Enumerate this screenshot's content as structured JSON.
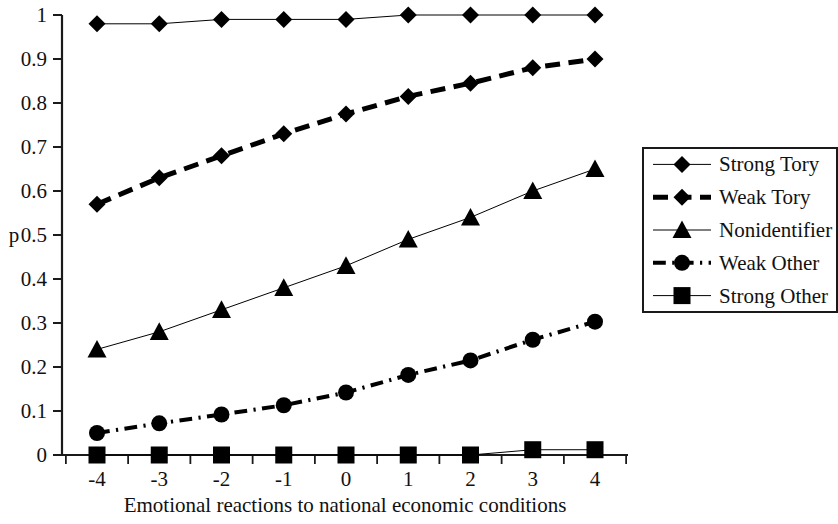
{
  "chart_data": {
    "type": "line",
    "title": "",
    "subtitle": "",
    "xlabel": "Emotional reactions to national economic conditions",
    "ylabel": "p",
    "x": [
      -4,
      -3,
      -2,
      -1,
      0,
      1,
      2,
      3,
      4
    ],
    "categories": [
      "-4",
      "-3",
      "-2",
      "-1",
      "0",
      "1",
      "2",
      "3",
      "4"
    ],
    "xtick_labels": [
      "-4",
      "-3",
      "-2",
      "-1",
      "0",
      "1",
      "2",
      "3",
      "4"
    ],
    "ytick_labels": [
      "0",
      "0.1",
      "0.2",
      "0.3",
      "0.4",
      "0.5",
      "0.6",
      "0.7",
      "0.8",
      "0.9",
      "1"
    ],
    "ytick_values": [
      0,
      0.1,
      0.2,
      0.3,
      0.4,
      0.5,
      0.6,
      0.7,
      0.8,
      0.9,
      1
    ],
    "xlim": [
      -4.6,
      4.6
    ],
    "ylim": [
      0,
      1
    ],
    "grid": false,
    "legend_position": "right",
    "series": [
      {
        "name": "Strong Tory",
        "marker": "diamond",
        "line_style": "solid",
        "line_width": 1,
        "color": "#000000",
        "values": [
          0.98,
          0.98,
          0.99,
          0.99,
          0.99,
          1.0,
          1.0,
          1.0,
          1.0
        ]
      },
      {
        "name": "Weak Tory",
        "marker": "diamond",
        "line_style": "dashed",
        "line_width": 5,
        "color": "#000000",
        "values": [
          0.57,
          0.63,
          0.68,
          0.73,
          0.775,
          0.815,
          0.845,
          0.88,
          0.9
        ]
      },
      {
        "name": "Nonidentifier",
        "marker": "triangle",
        "line_style": "solid",
        "line_width": 1,
        "color": "#000000",
        "values": [
          0.24,
          0.28,
          0.33,
          0.38,
          0.43,
          0.49,
          0.54,
          0.6,
          0.65
        ]
      },
      {
        "name": "Weak Other",
        "marker": "circle",
        "line_style": "dashdot",
        "line_width": 4,
        "color": "#000000",
        "values": [
          0.05,
          0.072,
          0.092,
          0.113,
          0.142,
          0.182,
          0.215,
          0.262,
          0.303
        ]
      },
      {
        "name": "Strong Other",
        "marker": "square",
        "line_style": "solid",
        "line_width": 1,
        "color": "#000000",
        "values": [
          0.0,
          0.0,
          0.0,
          0.0,
          0.0,
          0.0,
          0.0,
          0.012,
          0.012
        ]
      }
    ]
  },
  "legend": {
    "items": [
      {
        "label": "Strong Tory"
      },
      {
        "label": "Weak Tory"
      },
      {
        "label": "Nonidentifier"
      },
      {
        "label": "Weak Other"
      },
      {
        "label": "Strong Other"
      }
    ]
  },
  "axes": {
    "y_label": "p",
    "x_title": "Emotional reactions to national economic conditions"
  }
}
